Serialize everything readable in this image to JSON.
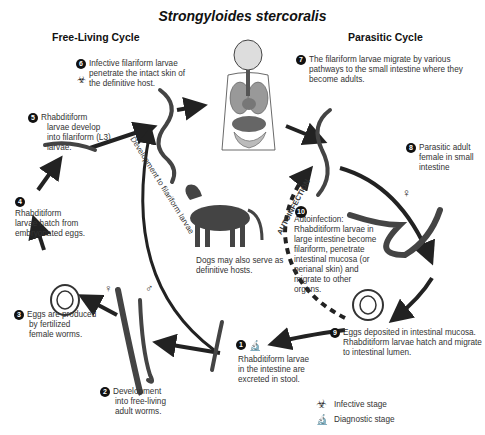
{
  "title": "Strongyloides stercoralis",
  "headers": {
    "free_living": "Free-Living Cycle",
    "parasitic": "Parasitic Cycle"
  },
  "steps": [
    {
      "num": "1",
      "text": "Rhabditiform larvae in the intestine are excreted in stool.",
      "lines": [
        "Rhabditiform larvae",
        "in the intestine are",
        "excreted in stool."
      ],
      "icon": "diagnostic-stage-icon"
    },
    {
      "num": "2",
      "lines": [
        "Development",
        "into free-living",
        "adult worms."
      ]
    },
    {
      "num": "3",
      "lines": [
        "Eggs are produced",
        "by fertilized",
        "female worms."
      ]
    },
    {
      "num": "4",
      "lines": [
        "Rhabditiform",
        "larvae hatch from",
        "embryonated eggs."
      ]
    },
    {
      "num": "5",
      "lines": [
        "Rhabditiform",
        "larvae develop",
        "into filariform (L3)",
        "larvae."
      ]
    },
    {
      "num": "6",
      "lines": [
        "Infective filariform larvae",
        "penetrate the intact skin of",
        "the definitive host."
      ],
      "icon": "infective-stage-icon"
    },
    {
      "num": "7",
      "lines": [
        "The filariform larvae migrate by various",
        "pathways to the small intestine where they",
        "become adults."
      ]
    },
    {
      "num": "8",
      "lines": [
        "Parasitic adult",
        "female in small",
        "intestine"
      ]
    },
    {
      "num": "9",
      "lines": [
        "Eggs deposited in intestinal mucosa.",
        "Rhabditiform larvae hatch and migrate",
        "to intestinal lumen."
      ]
    },
    {
      "num": "10",
      "lines": [
        "Autoinfection:",
        "Rhabditiform larvae in",
        "large intestine become",
        "filariform, penetrate",
        "intestinal mucosa (or",
        "perianal skin) and",
        "migrate to other",
        "organs."
      ]
    }
  ],
  "labels": {
    "development_arc": "Development to filariform larvae",
    "autoinfection_arc": "AUTOINFECTION",
    "dog_caption_1": "Dogs may also serve as",
    "dog_caption_2": "definitive hosts.",
    "female_symbol": "♀",
    "male_symbol": "♂"
  },
  "legend": [
    {
      "icon": "biohazard-icon",
      "label": "Infective stage"
    },
    {
      "icon": "microscope-icon",
      "label": "Diagnostic stage"
    }
  ],
  "colors": {
    "ink": "#222222",
    "organ_gray": "#9a9a9a",
    "dog": "#444444"
  }
}
